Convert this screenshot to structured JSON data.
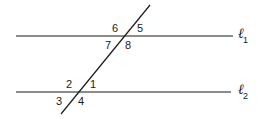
{
  "diagram": {
    "lines": [
      {
        "id": "l1",
        "name": "ℓ",
        "subscript": "1",
        "y": 36,
        "x1": 16,
        "x2": 233
      },
      {
        "id": "l2",
        "name": "ℓ",
        "subscript": "2",
        "y": 92,
        "x1": 16,
        "x2": 231
      }
    ],
    "transversal": {
      "x1": 150,
      "y1": 5,
      "x2": 61,
      "y2": 114
    },
    "angles": {
      "a1": "1",
      "a2": "2",
      "a3": "3",
      "a4": "4",
      "a5": "5",
      "a6": "6",
      "a7": "7",
      "a8": "8"
    },
    "stroke_color": "#1a1a1a"
  }
}
